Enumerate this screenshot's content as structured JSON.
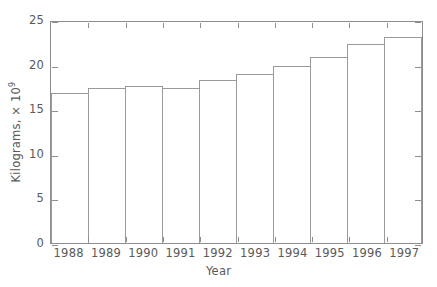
{
  "chart_data": {
    "type": "bar",
    "title": "",
    "xlabel": "Year",
    "ylabel": "Kilograms, × 10⁹",
    "ylabel_text": "Kilograms, × 10",
    "ylabel_exponent": "9",
    "categories": [
      "1988",
      "1989",
      "1990",
      "1991",
      "1992",
      "1993",
      "1994",
      "1995",
      "1996",
      "1997"
    ],
    "values": [
      16.8,
      17.4,
      17.6,
      17.4,
      18.3,
      19.0,
      19.9,
      20.9,
      22.3,
      23.1
    ],
    "ylim": [
      0,
      25
    ],
    "ytick_labels": [
      "0",
      "5",
      "10",
      "15",
      "20",
      "25"
    ],
    "ytick_values": [
      0,
      5,
      10,
      15,
      20,
      25
    ],
    "grid": false,
    "legend": false,
    "bar_style": "contiguous-outline",
    "colors": {
      "bar_edge": "#9a9a9a",
      "axis": "#8d8d8d",
      "text": "#5a5a5a",
      "background": "#ffffff"
    }
  }
}
